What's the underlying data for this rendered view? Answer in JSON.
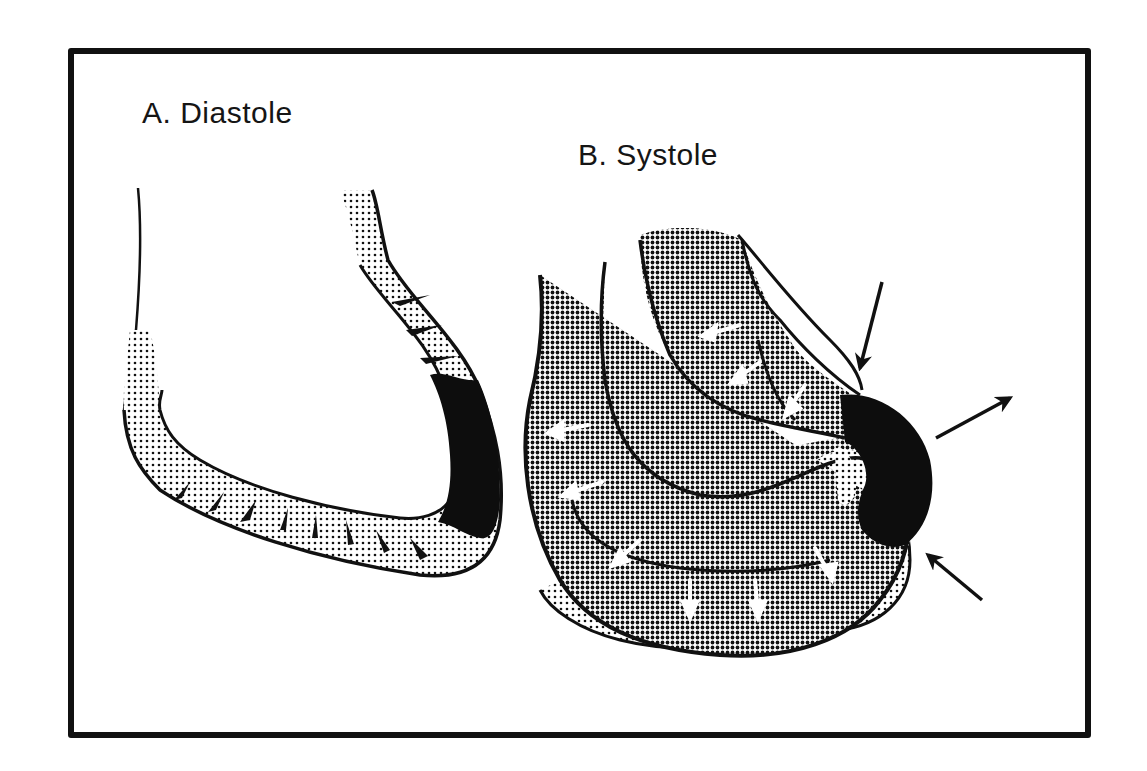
{
  "figure": {
    "panels": [
      {
        "id": "A",
        "label": "A. Diastole"
      },
      {
        "id": "B",
        "label": "B. Systole"
      }
    ],
    "colors": {
      "ink": "#111111",
      "light_stipple": "#d9d9d9",
      "dark_stipple": "#8a8a8a",
      "infarct": "#0d0d0d",
      "background": "#ffffff"
    }
  }
}
